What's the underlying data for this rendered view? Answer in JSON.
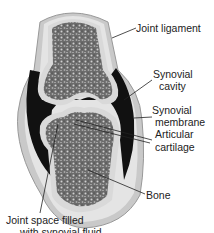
{
  "diagram": {
    "labels": {
      "joint_ligament": "Joint ligament",
      "synovial_cavity_1": "Synovial",
      "synovial_cavity_2": "cavity",
      "synovial_membrane_1": "Synovial",
      "synovial_membrane_2": "membrane",
      "articular_cartilage_1": "Articular",
      "articular_cartilage_2": "cartilage",
      "bone": "Bone",
      "joint_space_1": "Joint space filled",
      "joint_space_2": "with synovial fluid"
    },
    "colors": {
      "bone_texture": "#5a5a5a",
      "cartilage": "#d9d9d9",
      "synovial_fluid": "#111111",
      "ligament": "#bdbdbd",
      "leader_line": "#222222"
    }
  }
}
